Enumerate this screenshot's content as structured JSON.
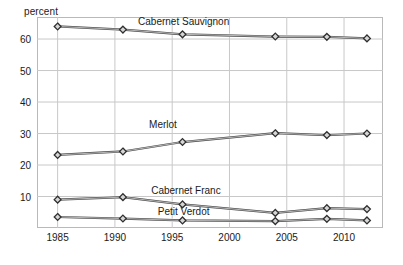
{
  "chart_data": {
    "type": "line",
    "title": "",
    "xlabel": "",
    "ylabel": "percent",
    "ylabel_text": "percent",
    "xlim": [
      1983.2,
      1983.2
    ],
    "ylim": [
      0,
      67
    ],
    "grid": true,
    "legend": "inline-series-labels",
    "y_ticks": [
      10,
      20,
      30,
      40,
      50,
      60
    ],
    "y_tick_labels": [
      "10",
      "20",
      "30",
      "40",
      "50",
      "60"
    ],
    "x_ticks": [
      1985,
      1990,
      1995,
      2000,
      2005,
      2010
    ],
    "x_tick_labels": [
      "1985",
      "1990",
      "1995",
      "2000",
      "2005",
      "2010"
    ],
    "x": [
      1985,
      1990.7,
      1995.9,
      2004,
      2008.5,
      2012
    ],
    "series": [
      {
        "name": "Cabernet Sauvignon",
        "label": "Cabernet Sauvignon",
        "values": [
          64,
          63,
          61.5,
          60.8,
          60.7,
          60.2
        ],
        "color": "#4a4a4a",
        "label_x": 1996.0,
        "label_y": 65.5
      },
      {
        "name": "Merlot",
        "label": "Merlot",
        "values": [
          23.2,
          24.3,
          27.3,
          30.1,
          29.5,
          30.0
        ],
        "color": "#4a4a4a",
        "label_x": 1994.2,
        "label_y": 32.6
      },
      {
        "name": "Cabernet Franc",
        "label": "Cabernet Franc",
        "values": [
          9.0,
          9.8,
          7.5,
          4.8,
          6.3,
          6.0
        ],
        "color": "#4a4a4a",
        "label_x": 1996.2,
        "label_y": 11.6
      },
      {
        "name": "Petit Verdot",
        "label": "Petit Verdot",
        "values": [
          3.5,
          3.0,
          2.4,
          2.2,
          2.9,
          2.4
        ],
        "color": "#4a4a4a",
        "label_x": 1996.0,
        "label_y": 5.2
      }
    ],
    "marker": "diamond",
    "axis_colors": {
      "grid": "#c8c8c8",
      "frame": "#b9b9b9",
      "line": "#3c3c3c",
      "text": "#1a1a1a"
    }
  }
}
